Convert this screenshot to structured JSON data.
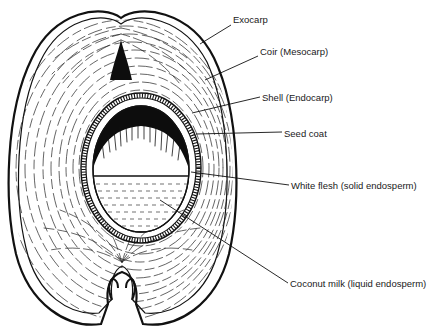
{
  "figure": {
    "colors": {
      "ink": "#111111",
      "background": "#ffffff"
    }
  },
  "labels": [
    {
      "id": "exocarp",
      "text": "Exocarp",
      "x": 233,
      "y": 20
    },
    {
      "id": "coir",
      "text": "Coir (Mesocarp)",
      "x": 260,
      "y": 51
    },
    {
      "id": "shell",
      "text": "Shell (Endocarp)",
      "x": 262,
      "y": 92
    },
    {
      "id": "seed-coat",
      "text": "Seed coat",
      "x": 284,
      "y": 128
    },
    {
      "id": "white-flesh",
      "text": "White flesh (solid endosperm)",
      "x": 291,
      "y": 181
    },
    {
      "id": "coconut-milk",
      "text": "Coconut milk (liquid endosperm)",
      "x": 290,
      "y": 279
    }
  ]
}
